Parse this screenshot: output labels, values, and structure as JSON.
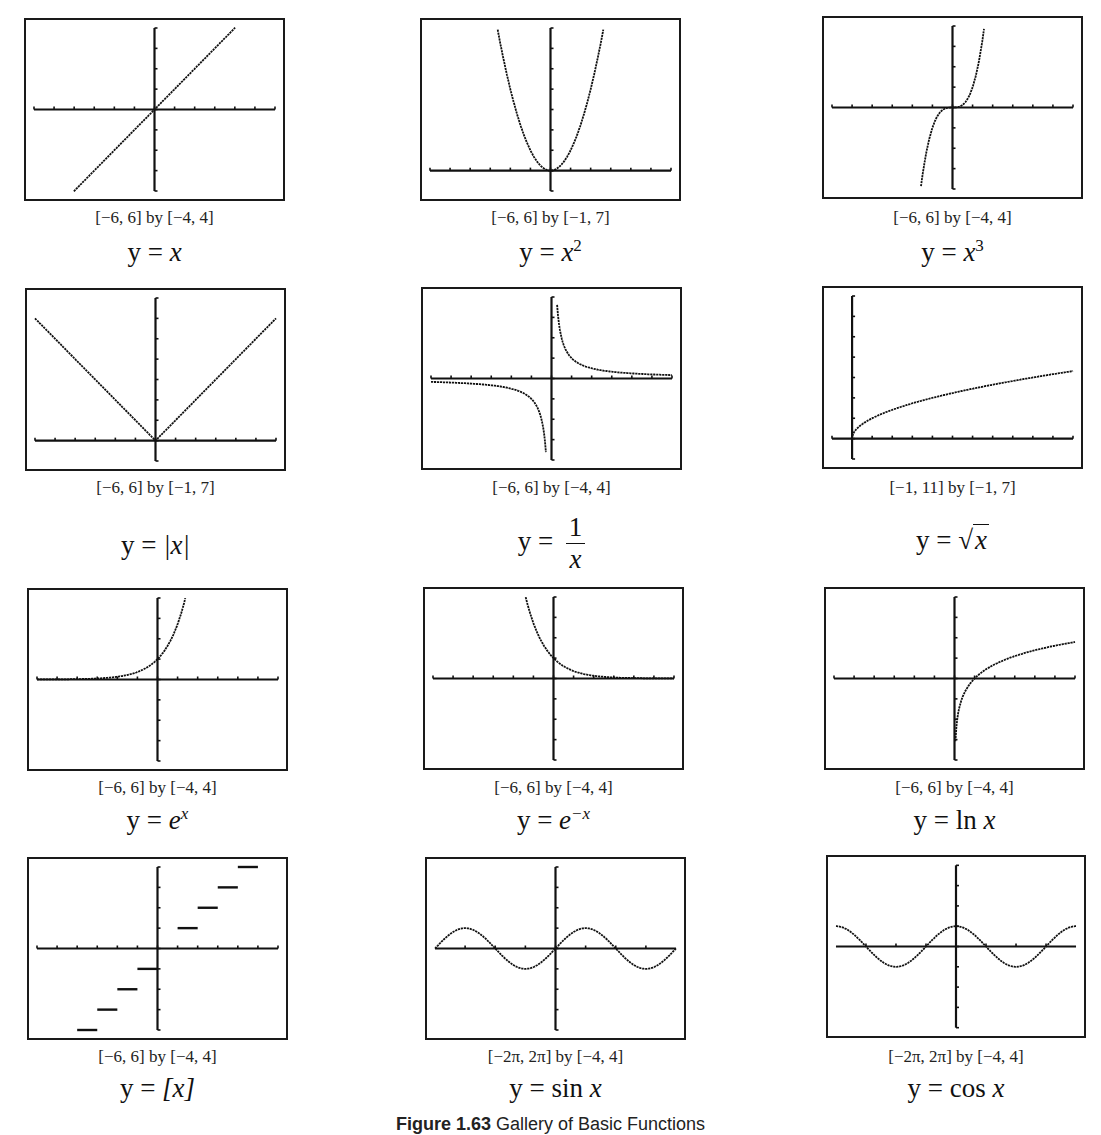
{
  "figure": {
    "number": "Figure 1.63",
    "title": "Gallery of Basic Functions"
  },
  "panels": [
    {
      "id": "identity",
      "equation": "y = x",
      "eq_lhs": "y =",
      "eq_rhs": "x",
      "window": "[−6, 6] by [−4, 4]"
    },
    {
      "id": "square",
      "equation": "y = x²",
      "eq_lhs": "y =",
      "eq_rhs": "x",
      "eq_sup": "2",
      "window": "[−6, 6] by [−1, 7]"
    },
    {
      "id": "cube",
      "equation": "y = x³",
      "eq_lhs": "y =",
      "eq_rhs": "x",
      "eq_sup": "3",
      "window": "[−6, 6] by [−4, 4]"
    },
    {
      "id": "abs",
      "equation": "y = |x|",
      "eq_lhs": "y =",
      "eq_rhs": "|x|",
      "window": "[−6, 6] by [−1, 7]"
    },
    {
      "id": "reciprocal",
      "equation": "y = 1/x",
      "eq_lhs": "y =",
      "eq_num": "1",
      "eq_den": "x",
      "window": "[−6, 6] by [−4, 4]"
    },
    {
      "id": "sqrt",
      "equation": "y = √x",
      "eq_lhs": "y =",
      "eq_rhs": "x",
      "window": "[−1, 11] by [−1, 7]"
    },
    {
      "id": "exp",
      "equation": "y = eˣ",
      "eq_lhs": "y =",
      "eq_rhs": "e",
      "eq_sup": "x",
      "window": "[−6, 6] by [−4, 4]"
    },
    {
      "id": "exp-neg",
      "equation": "y = e⁻ˣ",
      "eq_lhs": "y =",
      "eq_rhs": "e",
      "eq_sup": "−x",
      "window": "[−6, 6] by [−4, 4]"
    },
    {
      "id": "ln",
      "equation": "y = ln x",
      "eq_lhs": "y =",
      "eq_fn": "ln",
      "eq_rhs": "x",
      "window": "[−6, 6] by [−4, 4]"
    },
    {
      "id": "floor",
      "equation": "y = [x]",
      "eq_lhs": "y =",
      "eq_rhs": "[x]",
      "window": "[−6, 6] by [−4, 4]"
    },
    {
      "id": "sin",
      "equation": "y = sin x",
      "eq_lhs": "y =",
      "eq_fn": "sin",
      "eq_rhs": "x",
      "window": "[−2π, 2π] by [−4, 4]"
    },
    {
      "id": "cos",
      "equation": "y = cos x",
      "eq_lhs": "y =",
      "eq_fn": "cos",
      "eq_rhs": "x",
      "window": "[−2π, 2π] by [−4, 4]"
    }
  ],
  "chart_data": [
    {
      "type": "line",
      "title": "y = x",
      "xlim": [
        -6,
        6
      ],
      "ylim": [
        -4,
        4
      ],
      "xtick_step": 1,
      "ytick_step": 1,
      "x": [
        -4,
        -2,
        0,
        2,
        4
      ],
      "y": [
        -4,
        -2,
        0,
        2,
        4
      ],
      "caption": "[−6, 6] by [−4, 4]"
    },
    {
      "type": "line",
      "title": "y = x^2",
      "xlim": [
        -6,
        6
      ],
      "ylim": [
        -1,
        7
      ],
      "xtick_step": 1,
      "ytick_step": 1,
      "x": [
        -2.65,
        -2,
        -1,
        0,
        1,
        2,
        2.65
      ],
      "y": [
        7,
        4,
        1,
        0,
        1,
        4,
        7
      ],
      "caption": "[−6, 6] by [−1, 7]"
    },
    {
      "type": "line",
      "title": "y = x^3",
      "xlim": [
        -6,
        6
      ],
      "ylim": [
        -4,
        4
      ],
      "xtick_step": 1,
      "ytick_step": 1,
      "x": [
        -1.59,
        -1,
        0,
        1,
        1.59
      ],
      "y": [
        -4,
        -1,
        0,
        1,
        4
      ],
      "caption": "[−6, 6] by [−4, 4]"
    },
    {
      "type": "line",
      "title": "y = |x|",
      "xlim": [
        -6,
        6
      ],
      "ylim": [
        -1,
        7
      ],
      "xtick_step": 1,
      "ytick_step": 1,
      "x": [
        -6,
        -3,
        0,
        3,
        6
      ],
      "y": [
        6,
        3,
        0,
        3,
        6
      ],
      "caption": "[−6, 6] by [−1, 7]"
    },
    {
      "type": "line",
      "title": "y = 1/x",
      "xlim": [
        -6,
        6
      ],
      "ylim": [
        -4,
        4
      ],
      "xtick_step": 1,
      "ytick_step": 1,
      "x": [
        -6,
        -2,
        -1,
        -0.25,
        0.25,
        1,
        2,
        6
      ],
      "y": [
        -0.17,
        -0.5,
        -1,
        -4,
        4,
        1,
        0.5,
        0.17
      ],
      "caption": "[−6, 6] by [−4, 4]"
    },
    {
      "type": "line",
      "title": "y = sqrt(x)",
      "xlim": [
        -1,
        11
      ],
      "ylim": [
        -1,
        7
      ],
      "xtick_step": 1,
      "ytick_step": 1,
      "x": [
        0,
        1,
        4,
        9,
        11
      ],
      "y": [
        0,
        1,
        2,
        3,
        3.32
      ],
      "caption": "[−1, 11] by [−1, 7]"
    },
    {
      "type": "line",
      "title": "y = e^x",
      "xlim": [
        -6,
        6
      ],
      "ylim": [
        -4,
        4
      ],
      "xtick_step": 1,
      "ytick_step": 1,
      "x": [
        -6,
        -2,
        0,
        1,
        1.39
      ],
      "y": [
        0,
        0.14,
        1,
        2.72,
        4
      ],
      "caption": "[−6, 6] by [−4, 4]"
    },
    {
      "type": "line",
      "title": "y = e^-x",
      "xlim": [
        -6,
        6
      ],
      "ylim": [
        -4,
        4
      ],
      "xtick_step": 1,
      "ytick_step": 1,
      "x": [
        -1.39,
        -1,
        0,
        2,
        6
      ],
      "y": [
        4,
        2.72,
        1,
        0.14,
        0
      ],
      "caption": "[−6, 6] by [−4, 4]"
    },
    {
      "type": "line",
      "title": "y = ln x",
      "xlim": [
        -6,
        6
      ],
      "ylim": [
        -4,
        4
      ],
      "xtick_step": 1,
      "ytick_step": 1,
      "x": [
        0.07,
        0.5,
        1,
        2,
        6
      ],
      "y": [
        -2.7,
        -0.69,
        0,
        0.69,
        1.79
      ],
      "caption": "[−6, 6] by [−4, 4]"
    },
    {
      "type": "step",
      "title": "y = [x]",
      "xlim": [
        -6,
        6
      ],
      "ylim": [
        -4,
        4
      ],
      "xtick_step": 1,
      "ytick_step": 1,
      "x": [
        -4,
        -3,
        -2,
        -1,
        0,
        1,
        2,
        3,
        4
      ],
      "y": [
        -4,
        -3,
        -2,
        -1,
        0,
        1,
        2,
        3,
        4
      ],
      "caption": "[−6, 6] by [−4, 4]"
    },
    {
      "type": "line",
      "title": "y = sin x",
      "xlim": [
        -6.283,
        6.283
      ],
      "ylim": [
        -4,
        4
      ],
      "xtick_step": 1.571,
      "ytick_step": 1,
      "x": [
        -6.283,
        -4.712,
        -3.142,
        -1.571,
        0,
        1.571,
        3.142,
        4.712,
        6.283
      ],
      "y": [
        0,
        1,
        0,
        -1,
        0,
        1,
        0,
        -1,
        0
      ],
      "caption": "[−2π, 2π] by [−4, 4]"
    },
    {
      "type": "line",
      "title": "y = cos x",
      "xlim": [
        -6.283,
        6.283
      ],
      "ylim": [
        -4,
        4
      ],
      "xtick_step": 1.571,
      "ytick_step": 1,
      "x": [
        -6.283,
        -4.712,
        -3.142,
        -1.571,
        0,
        1.571,
        3.142,
        4.712,
        6.283
      ],
      "y": [
        1,
        0,
        -1,
        0,
        1,
        0,
        -1,
        0,
        1
      ],
      "caption": "[−2π, 2π] by [−4, 4]"
    }
  ]
}
